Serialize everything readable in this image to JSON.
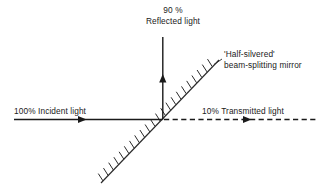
{
  "diagram": {
    "title_absent": true,
    "labels": {
      "reflected_pct": "90 %",
      "reflected_text": "Reflected light",
      "incident": "100% Incident light",
      "transmitted": "10% Transmitted light",
      "mirror_line1": "'Half-silvered'",
      "mirror_line2": "beam-splitting mirror"
    },
    "colors": {
      "background": "#ffffff",
      "ink": "#1a1a1a",
      "ray": "#1a1a1a",
      "mirror": "#333333"
    },
    "rays": [
      {
        "name": "incident-ray",
        "style": "solid",
        "direction": "rightward",
        "percent": "100%"
      },
      {
        "name": "reflected-ray",
        "style": "solid",
        "direction": "upward",
        "percent": "90 %"
      },
      {
        "name": "transmitted-ray",
        "style": "dashed",
        "direction": "rightward",
        "percent": "10%"
      }
    ],
    "mirror": {
      "name": "half-silvered-mirror",
      "orientation": "diagonal-45",
      "hatching": "upper-left"
    }
  }
}
